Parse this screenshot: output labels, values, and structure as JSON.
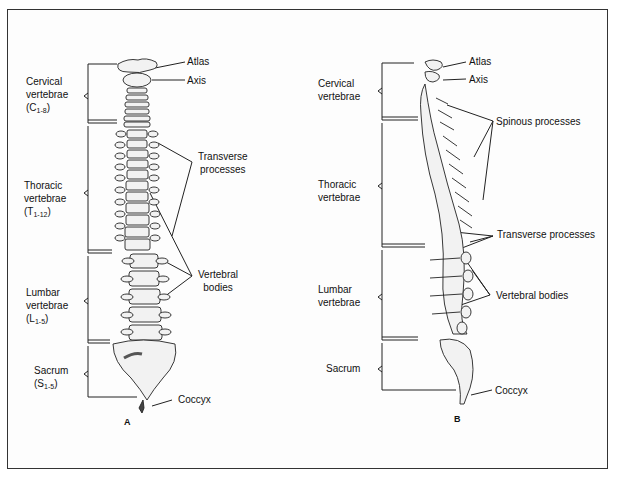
{
  "figure": {
    "panels": [
      {
        "id": "A",
        "view": "anterior",
        "letter": "A",
        "regions": [
          {
            "name": "Cervical",
            "line2": "vertebrae",
            "range_prefix": "(C",
            "range_sub": "1-8",
            "range_suffix": ")"
          },
          {
            "name": "Thoracic",
            "line2": "vertebrae",
            "range_prefix": "(T",
            "range_sub": "1-12",
            "range_suffix": ")"
          },
          {
            "name": "Lumbar",
            "line2": "vertebrae",
            "range_prefix": "(L",
            "range_sub": "1-5",
            "range_suffix": ")"
          },
          {
            "name": "Sacrum",
            "range_prefix": "(S",
            "range_sub": "1-5",
            "range_suffix": ")"
          }
        ],
        "callouts": {
          "atlas": "Atlas",
          "axis": "Axis",
          "transverse_1": "Transverse",
          "transverse_2": "processes",
          "vertebral_1": "Vertebral",
          "vertebral_2": "bodies",
          "coccyx": "Coccyx"
        }
      },
      {
        "id": "B",
        "view": "lateral",
        "letter": "B",
        "regions": [
          {
            "name": "Cervical",
            "line2": "vertebrae"
          },
          {
            "name": "Thoracic",
            "line2": "vertebrae"
          },
          {
            "name": "Lumbar",
            "line2": "vertebrae"
          },
          {
            "name": "Sacrum"
          }
        ],
        "callouts": {
          "atlas": "Atlas",
          "axis": "Axis",
          "spinous": "Spinous processes",
          "transverse": "Transverse processes",
          "vertebral": "Vertebral bodies",
          "coccyx": "Coccyx"
        }
      }
    ],
    "colors": {
      "line": "#222222",
      "bone_fill": "#f2f2f2",
      "bone_shade": "#555555",
      "frame": "#333333"
    }
  }
}
